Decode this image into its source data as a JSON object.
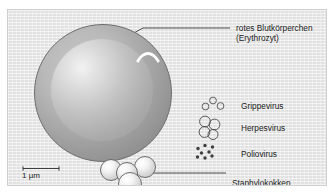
{
  "figure": {
    "kind": "scientific-illustration",
    "background_color": "#e9e9e9",
    "border_color": "#cfcfcf",
    "outline_color": "#6e6e6e",
    "text_color": "#1c1c1c"
  },
  "labels": {
    "rbc_line1": "rotes Blutkörperchen",
    "rbc_line2": "(Erythrozyt)",
    "grippevirus": "Grippevirus",
    "herpesvirus": "Herpesvirus",
    "poliovirus": "Poliovirus",
    "staphylokokken": "Staphylokokken"
  },
  "scale_bar": {
    "length_label": "1 µm",
    "equivalence_prefix": "=",
    "numerator": "1",
    "denominator": "1000",
    "unit": "mm"
  },
  "icons": {
    "rbc": "red-blood-cell-sphere",
    "staphylococci": "staphylococcus-cluster",
    "grippevirus": "influenza-virus-particles",
    "herpesvirus": "herpes-virus-particles",
    "poliovirus": "polio-virus-dots",
    "scale_bar": "scale-bar-icon"
  },
  "counts": {
    "staphylococci_spheres": 4,
    "grippevirus_particles": 3,
    "herpesvirus_particles": 4,
    "poliovirus_dots": 8
  }
}
